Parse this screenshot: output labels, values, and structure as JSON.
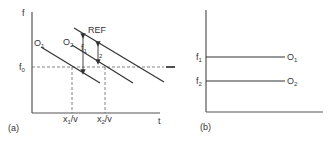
{
  "panel_a": {
    "label": "(a)",
    "y_axis_label": "f",
    "x_axis_label": "t",
    "f0_label": "f",
    "f0_sub": "0",
    "lines": [
      {
        "name": "O",
        "sub": "1"
      },
      {
        "name": "O",
        "sub": "2"
      },
      {
        "name": "REF",
        "sub": ""
      }
    ],
    "f1_label": "f",
    "f1_sub": "1",
    "f2_label": "f",
    "f2_sub": "2",
    "x1_label": "x",
    "x1_sub": "1",
    "x1_suffix": "/v",
    "x2_label": "x",
    "x2_sub": "2",
    "x2_suffix": "/v"
  },
  "panel_b": {
    "label": "(b)",
    "levels": [
      {
        "f_label": "f",
        "f_sub": "1",
        "o_label": "O",
        "o_sub": "1"
      },
      {
        "f_label": "f",
        "f_sub": "2",
        "o_label": "O",
        "o_sub": "2"
      }
    ]
  }
}
